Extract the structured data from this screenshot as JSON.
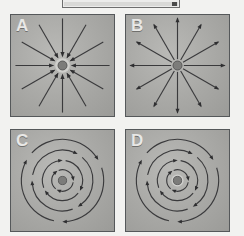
{
  "top_box": {
    "name": "caption-box",
    "label": "",
    "border_color": "#6e6e6e",
    "fill_color": "#ececeb",
    "handle_color": "#4a4a4a"
  },
  "figure": {
    "layout": "2x2-grid",
    "panel_background": "#a8a8a5",
    "panel_border_color": "#55585a",
    "line_color": "#3a3a3c",
    "arrow_color": "#2e2e30",
    "center_dot_color": "#7c7c7a",
    "label_color": "#e8e8e6"
  },
  "panels": [
    {
      "id": "A",
      "label": "A",
      "field_type": "radial",
      "direction": "inward",
      "description": "radial-sink-converging-inward",
      "ray_count": 12,
      "arrow_position": "inner",
      "has_center_dot": true
    },
    {
      "id": "B",
      "label": "B",
      "field_type": "radial",
      "direction": "outward",
      "description": "radial-source-diverging-outward",
      "ray_count": 12,
      "arrow_position": "outer",
      "has_center_dot": true
    },
    {
      "id": "C",
      "label": "C",
      "field_type": "circular",
      "direction": "clockwise",
      "description": "rotational-circulating-field",
      "ring_count": 4,
      "arrows_per_ring": 3,
      "has_center_dot": true
    },
    {
      "id": "D",
      "label": "D",
      "field_type": "circular",
      "direction": "clockwise",
      "description": "rotational-circulating-field",
      "ring_count": 4,
      "arrows_per_ring": 3,
      "has_center_dot": true
    }
  ]
}
